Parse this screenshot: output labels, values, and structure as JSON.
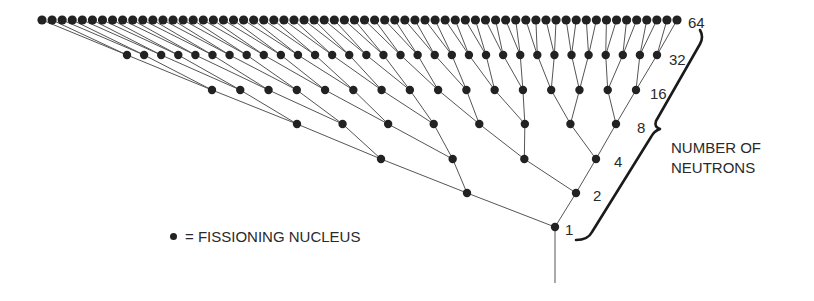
{
  "diagram": {
    "type": "chain-reaction-tree",
    "colors": {
      "node": "#222222",
      "edge": "#555555",
      "brace": "#1a1a1a",
      "text": "#2a2a2a"
    },
    "stem": {
      "x": 555,
      "y_top": 227,
      "y_bottom": 283
    },
    "levels": [
      {
        "count": 1,
        "y": 227,
        "x_first": 555,
        "x_last": 555,
        "label": "1",
        "label_x": 565,
        "label_y": 222
      },
      {
        "count": 2,
        "y": 193,
        "x_first": 467,
        "x_last": 576,
        "label": "2",
        "label_x": 593,
        "label_y": 188
      },
      {
        "count": 4,
        "y": 159,
        "x_first": 381,
        "x_last": 596,
        "label": "4",
        "label_x": 614,
        "label_y": 154
      },
      {
        "count": 8,
        "y": 124,
        "x_first": 297,
        "x_last": 616,
        "label": "8",
        "label_x": 637,
        "label_y": 120
      },
      {
        "count": 16,
        "y": 90,
        "x_first": 212,
        "x_last": 636,
        "label": "16",
        "label_x": 650,
        "label_y": 86
      },
      {
        "count": 32,
        "y": 55,
        "x_first": 127,
        "x_last": 657,
        "label": "32",
        "label_x": 669,
        "label_y": 52
      },
      {
        "count": 64,
        "y": 20,
        "x_first": 42,
        "x_last": 677,
        "label": "64",
        "label_x": 688,
        "label_y": 15
      }
    ]
  },
  "caption": {
    "line1": "NUMBER OF",
    "line2": "NEUTRONS"
  },
  "legend": {
    "text": "= FISSIONING NUCLEUS"
  }
}
